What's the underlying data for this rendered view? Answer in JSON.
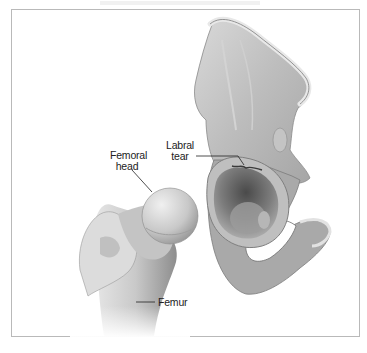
{
  "figure": {
    "labels": {
      "femoral_head_line1": "Femoral",
      "femoral_head_line2": "head",
      "labral_tear_line1": "Labral",
      "labral_tear_line2": "tear",
      "femur": "Femur"
    },
    "colors": {
      "border": "#b9b9b9",
      "bone_light": "#e4e4e4",
      "bone_mid": "#b8b8b8",
      "bone_dark": "#6e6e6e",
      "label_text": "#222222"
    }
  }
}
